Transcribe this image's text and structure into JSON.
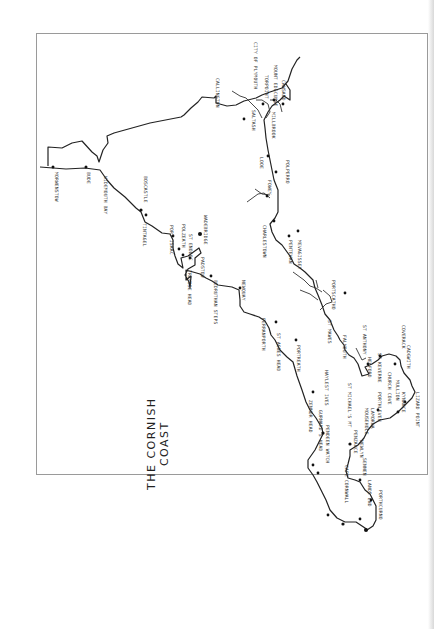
{
  "map": {
    "title_line1": "THE CORNISH",
    "title_line2": "COAST",
    "north_coast": [
      {
        "name": "MORWENSTOW"
      },
      {
        "name": "BUDE"
      },
      {
        "name": "WIDEMOUTH BAY"
      },
      {
        "name": "BOSCASTLE"
      },
      {
        "name": "TINTAGEL"
      },
      {
        "name": "PORT ISAAC"
      },
      {
        "name": "POLZEATH"
      },
      {
        "name": "ST ENODOC"
      },
      {
        "name": "WADEBRIDGE"
      },
      {
        "name": "PADSTOW"
      },
      {
        "name": "TREVOSE HEAD"
      },
      {
        "name": "BEDRUTHAN STEPS"
      },
      {
        "name": "NEWQUAY"
      },
      {
        "name": "PERRANPORTH"
      },
      {
        "name": "ST AGNES HEAD"
      },
      {
        "name": "PORTREATH"
      },
      {
        "name": "HAYLE"
      },
      {
        "name": "ST IVES"
      },
      {
        "name": "ZENNOR HEAD"
      },
      {
        "name": "GURNARD'S HEAD"
      },
      {
        "name": "PENDEEN WATCH"
      },
      {
        "name": "CAPE CORNWALL"
      },
      {
        "name": "LANDS END"
      }
    ],
    "south_coast": [
      {
        "name": "SENNEN"
      },
      {
        "name": "PORTHCURNO"
      },
      {
        "name": "PENZANCE"
      },
      {
        "name": "NEWLYN"
      },
      {
        "name": "MOUSEHOLE"
      },
      {
        "name": "LAMORNA"
      },
      {
        "name": "ST MICHAEL'S MT"
      },
      {
        "name": "PORTHLEVEN"
      },
      {
        "name": "CHURCH COVE"
      },
      {
        "name": "MULLION"
      },
      {
        "name": "KYNANCE"
      },
      {
        "name": "LIZARD POINT"
      },
      {
        "name": "CADGWITH"
      },
      {
        "name": "COVERACK"
      },
      {
        "name": "ST KEVERNE"
      },
      {
        "name": "HELFORD"
      },
      {
        "name": "ST ANTHONY"
      },
      {
        "name": "FALMOUTH"
      },
      {
        "name": "ST MAWES"
      },
      {
        "name": "PORTSCATHO"
      },
      {
        "name": "MEVAGISSEY"
      },
      {
        "name": "PENTEWAN"
      },
      {
        "name": "CHARLESTOWN"
      },
      {
        "name": "FOWEY"
      },
      {
        "name": "POLPERRO"
      },
      {
        "name": "LOOE"
      },
      {
        "name": "MILLBROOK"
      },
      {
        "name": "SALTASH"
      },
      {
        "name": "CAWSAND"
      },
      {
        "name": "MOUNT EDGCUMBE"
      },
      {
        "name": "TORPOINT"
      },
      {
        "name": "CITY OF PLYMOUTH"
      },
      {
        "name": "CALLINGTON"
      }
    ]
  }
}
